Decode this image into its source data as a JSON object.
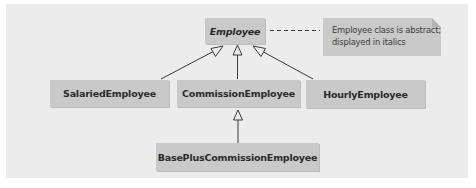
{
  "diagram": {
    "type": "UML class diagram (inheritance hierarchy)",
    "classes": [
      {
        "id": "employee",
        "name": "Employee",
        "abstract": true
      },
      {
        "id": "salaried",
        "name": "SalariedEmployee",
        "abstract": false
      },
      {
        "id": "commission",
        "name": "CommissionEmployee",
        "abstract": false
      },
      {
        "id": "hourly",
        "name": "HourlyEmployee",
        "abstract": false
      },
      {
        "id": "basePlus",
        "name": "BasePlusCommissionEmployee",
        "abstract": false
      }
    ],
    "note": {
      "line1": "Employee class is abstract;",
      "line2": "displayed in italics",
      "attached_to": "employee"
    },
    "relationships": [
      {
        "type": "generalization",
        "from": "salaried",
        "to": "employee"
      },
      {
        "type": "generalization",
        "from": "commission",
        "to": "employee"
      },
      {
        "type": "generalization",
        "from": "hourly",
        "to": "employee"
      },
      {
        "type": "generalization",
        "from": "basePlus",
        "to": "commission"
      },
      {
        "type": "note-anchor",
        "from": "note",
        "to": "employee",
        "style": "dashed"
      }
    ],
    "colors": {
      "background": "#ececec",
      "box_fill": "#c9c9c9",
      "line": "#3a3a3a",
      "text": "#2a2a2a"
    }
  }
}
